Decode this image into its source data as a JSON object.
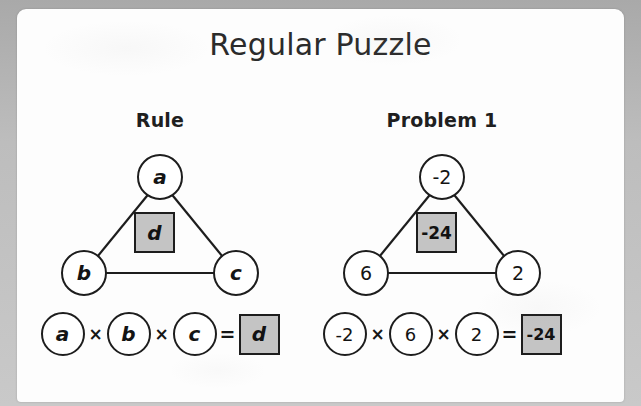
{
  "page": {
    "title": "Regular Puzzle",
    "background_color": "#b8b8b8",
    "card_color": "#fdfdfd",
    "ink_color": "#1d1d1d",
    "box_fill_color": "#c4c4c4"
  },
  "panels": [
    {
      "heading": "Rule",
      "style": "variables",
      "triangle": {
        "top_node": "a",
        "left_node": "b",
        "right_node": "c",
        "center_box": "d"
      },
      "equation": {
        "terms": [
          "a",
          "b",
          "c"
        ],
        "operator": "×",
        "equals": "=",
        "result": "d"
      }
    },
    {
      "heading": "Problem 1",
      "style": "numbers",
      "triangle": {
        "top_node": "-2",
        "left_node": "6",
        "right_node": "2",
        "center_box": "-24"
      },
      "equation": {
        "terms": [
          "-2",
          "6",
          "2"
        ],
        "operator": "×",
        "equals": "=",
        "result": "-24"
      }
    }
  ]
}
